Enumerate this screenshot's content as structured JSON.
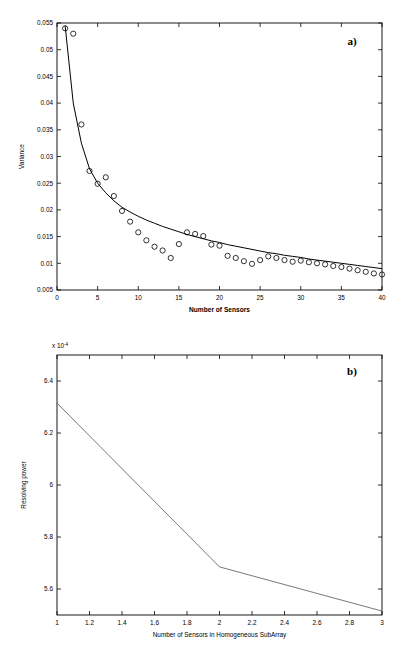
{
  "figure": {
    "background": "#ffffff",
    "line_color": "#000000",
    "marker_color": "#000000"
  },
  "panels": [
    {
      "tag": "a)",
      "chart_data": {
        "type": "scatter",
        "title": "",
        "xlabel": "Number of Sensors",
        "ylabel": "Variance",
        "xlim": [
          0,
          40
        ],
        "ylim": [
          0.005,
          0.055
        ],
        "xticks": [
          0,
          5,
          10,
          15,
          20,
          25,
          30,
          35,
          40
        ],
        "xticklabels": [
          "0",
          "5",
          "10",
          "15",
          "20",
          "25",
          "30",
          "35",
          "40"
        ],
        "yticks": [
          0.005,
          0.01,
          0.015,
          0.02,
          0.025,
          0.03,
          0.035,
          0.04,
          0.045,
          0.05,
          0.055
        ],
        "yticklabels": [
          "0.005",
          "0.01",
          "0.015",
          "0.02",
          "0.025",
          "0.03",
          "0.035",
          "0.04",
          "0.045",
          "0.05",
          "0.055"
        ],
        "grid": false,
        "legend": null,
        "series": [
          {
            "name": "Empirical variance",
            "style": "open-circle-markers",
            "x": [
              1,
              2,
              3,
              4,
              5,
              6,
              7,
              8,
              9,
              10,
              11,
              12,
              13,
              14,
              15,
              16,
              17,
              18,
              19,
              20,
              21,
              22,
              23,
              24,
              25,
              26,
              27,
              28,
              29,
              30,
              31,
              32,
              33,
              34,
              35,
              36,
              37,
              38,
              39,
              40
            ],
            "values": [
              0.054,
              0.053,
              0.036,
              0.0273,
              0.0249,
              0.0261,
              0.0226,
              0.0198,
              0.0178,
              0.0158,
              0.0143,
              0.0131,
              0.0124,
              0.011,
              0.0136,
              0.0158,
              0.0155,
              0.0151,
              0.0135,
              0.0133,
              0.0114,
              0.011,
              0.0104,
              0.0099,
              0.0106,
              0.0113,
              0.011,
              0.0106,
              0.0103,
              0.0105,
              0.0102,
              0.01,
              0.0098,
              0.0095,
              0.0093,
              0.009,
              0.0087,
              0.0084,
              0.0081,
              0.0079
            ]
          },
          {
            "name": "Theoretical fit",
            "style": "solid-curve",
            "x": [
              1,
              2,
              3,
              4,
              5,
              6,
              7,
              8,
              9,
              10,
              11,
              12,
              13,
              14,
              15,
              16,
              17,
              18,
              19,
              20,
              21,
              22,
              23,
              24,
              25,
              26,
              27,
              28,
              29,
              30,
              31,
              32,
              33,
              34,
              35,
              36,
              37,
              38,
              39,
              40
            ],
            "values": [
              0.0545,
              0.04,
              0.0325,
              0.0277,
              0.025,
              0.0232,
              0.0217,
              0.0205,
              0.0196,
              0.0188,
              0.0181,
              0.0175,
              0.0169,
              0.0164,
              0.0159,
              0.0154,
              0.015,
              0.0146,
              0.0142,
              0.0139,
              0.0135,
              0.0132,
              0.0129,
              0.0126,
              0.0123,
              0.012,
              0.0118,
              0.0115,
              0.0113,
              0.0111,
              0.0108,
              0.0106,
              0.0104,
              0.0102,
              0.01,
              0.0098,
              0.0096,
              0.0094,
              0.0092,
              0.009
            ]
          }
        ]
      }
    },
    {
      "tag": "b)",
      "chart_data": {
        "type": "line",
        "title": "",
        "xlabel": "Number of Sensors in Homogeneous SubArray",
        "ylabel": "Resolving power",
        "y_exponent_label": "x 10",
        "y_exponent_power": "-4",
        "xlim": [
          1,
          3
        ],
        "ylim": [
          5.5,
          6.5
        ],
        "xticks": [
          1,
          1.2,
          1.4,
          1.6,
          1.8,
          2,
          2.2,
          2.4,
          2.6,
          2.8,
          3
        ],
        "xticklabels": [
          "1",
          "1.2",
          "1.4",
          "1.6",
          "1.8",
          "2",
          "2.2",
          "2.4",
          "2.6",
          "2.8",
          "3"
        ],
        "yticks": [
          5.6,
          5.8,
          6,
          6.2,
          6.4
        ],
        "yticklabels": [
          "5.6",
          "5.8",
          "6",
          "6.2",
          "6.4"
        ],
        "grid": false,
        "legend": null,
        "series": [
          {
            "name": "Resolving power",
            "style": "solid-line",
            "x": [
              1,
              2,
              3
            ],
            "values": [
              6.315,
              5.685,
              5.515
            ]
          }
        ]
      }
    }
  ]
}
